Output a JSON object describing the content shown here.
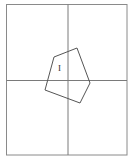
{
  "diagram": {
    "type": "geometry-quadrant-figure",
    "frame": {
      "x1": 6,
      "y1": 4,
      "x2": 127,
      "y2": 155,
      "stroke": "#8a8a8a"
    },
    "axes": {
      "vertical": {
        "x": 68,
        "y1": 4,
        "y2": 155
      },
      "horizontal": {
        "y": 80,
        "x1": 6,
        "x2": 127
      },
      "stroke": "#7a7a7a"
    },
    "shape": {
      "name": "pentagon",
      "points": [
        [
          54,
          57
        ],
        [
          77,
          48
        ],
        [
          90,
          83
        ],
        [
          80,
          103
        ],
        [
          45,
          90
        ]
      ],
      "stroke": "#555555"
    },
    "label": {
      "text": "I",
      "x": 58,
      "y": 64
    }
  }
}
